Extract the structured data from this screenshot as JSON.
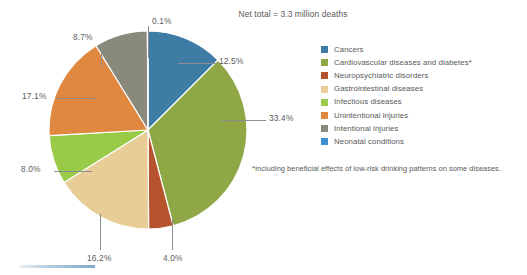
{
  "title": "Net total = 3.3 million deaths",
  "footnote": "*Including beneficial effects of low-risk drinking patterns on some diseases.",
  "legend": {
    "items": [
      {
        "label": "Cancers",
        "color": "#3e7ca5"
      },
      {
        "label": "Cardiovascular diseases and diabetes*",
        "color": "#8fa845"
      },
      {
        "label": "Neuropsychiatric disorders",
        "color": "#b5542c"
      },
      {
        "label": "Gastrointestinal diseases",
        "color": "#e8ce96"
      },
      {
        "label": "Infectious diseases",
        "color": "#9acb48"
      },
      {
        "label": "Unintentional injuries",
        "color": "#e08840"
      },
      {
        "label": "Intentional injuries",
        "color": "#8a8a7c"
      },
      {
        "label": "Neonatal conditions",
        "color": "#3e8ecc"
      }
    ]
  },
  "labels": {
    "p0": "0.1%",
    "p1": "12.5%",
    "p2": "33.4%",
    "p3": "4.0%",
    "p4": "16.2%",
    "p5": "8.0%",
    "p6": "17.1%",
    "p7": "8.7%"
  },
  "chart_data": {
    "type": "pie",
    "title": "Net total = 3.3 million deaths",
    "subtitle": "",
    "note": "*Including beneficial effects of low-risk drinking patterns on some diseases.",
    "unit": "percent of deaths",
    "total_label": "3.3 million deaths",
    "start_angle_deg": 0,
    "direction": "clockwise",
    "legend_position": "right",
    "categories": [
      "Cancers",
      "Cardiovascular diseases and diabetes*",
      "Neuropsychiatric disorders",
      "Gastrointestinal diseases",
      "Infectious diseases",
      "Unintentional injuries",
      "Intentional injuries",
      "Neonatal conditions"
    ],
    "values": [
      12.5,
      33.4,
      4.0,
      16.2,
      8.0,
      17.1,
      8.7,
      0.1
    ],
    "data_labels": [
      "12.5%",
      "33.4%",
      "4.0%",
      "16.2%",
      "8.0%",
      "17.1%",
      "8.7%",
      "0.1%"
    ],
    "colors": [
      "#3e7ca5",
      "#8fa845",
      "#b5542c",
      "#e8ce96",
      "#9acb48",
      "#e08840",
      "#8a8a7c",
      "#3e8ecc"
    ]
  }
}
